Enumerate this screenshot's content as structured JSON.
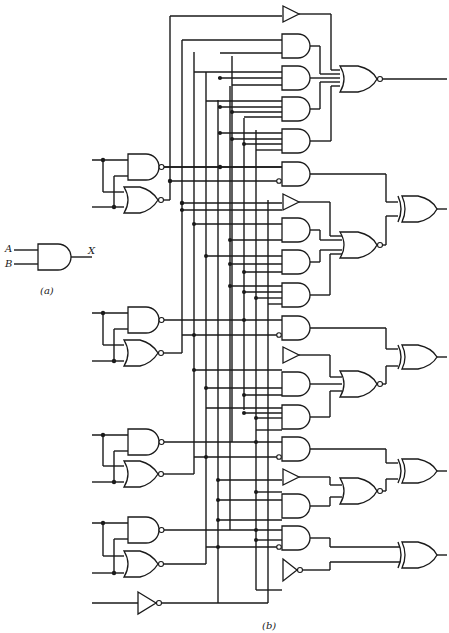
{
  "figure": {
    "part_a": {
      "caption": "(a)",
      "inputs": [
        "A",
        "B"
      ],
      "output": "X",
      "gate": "AND"
    },
    "part_b": {
      "caption": "(b)",
      "description": "4-bit arithmetic logic unit gate-level schematic",
      "input_stages": [
        {
          "id": "stage-1",
          "gates": [
            "NAND",
            "NOR"
          ],
          "y": 170
        },
        {
          "id": "stage-2",
          "gates": [
            "NAND",
            "NOR"
          ],
          "y": 335
        },
        {
          "id": "stage-3",
          "gates": [
            "NAND",
            "NOR"
          ],
          "y": 455
        },
        {
          "id": "stage-4",
          "gates": [
            "NAND",
            "NOR"
          ],
          "y": 545
        }
      ],
      "carry_inverter_y": 603,
      "output_blocks": [
        {
          "id": "out-top",
          "final_gate": "NOR",
          "y": 107
        },
        {
          "id": "out-1",
          "final_gate": "XOR",
          "y": 210
        },
        {
          "id": "out-2",
          "final_gate": "XOR",
          "y": 357
        },
        {
          "id": "out-3",
          "final_gate": "XOR",
          "y": 471
        },
        {
          "id": "out-4",
          "final_gate": "XOR",
          "y": 555
        }
      ]
    }
  }
}
